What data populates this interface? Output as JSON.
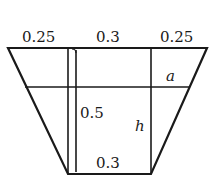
{
  "diagram": {
    "stroke_color": "#1a1a1a",
    "labels": {
      "top_left_width": "0.25",
      "top_middle_width": "0.3",
      "top_right_width": "0.25",
      "depth_label": "0.5",
      "water_height": "h",
      "freeboard": "a",
      "bottom_width": "0.3"
    }
  }
}
